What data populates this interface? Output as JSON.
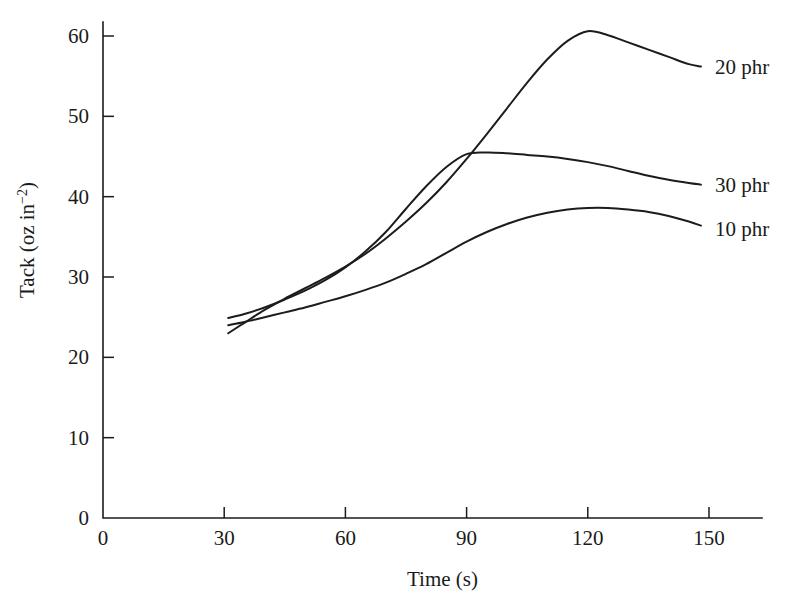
{
  "chart_data": {
    "type": "line",
    "title": "",
    "xlabel": "Time (s)",
    "ylabel": "Tack (oz in⁻²)",
    "ylabel_base": "Tack (oz in",
    "ylabel_exp": "−2",
    "ylabel_close": ")",
    "xlim": [
      0,
      160
    ],
    "ylim": [
      0,
      63
    ],
    "xticks": [
      0,
      30,
      60,
      90,
      120,
      150
    ],
    "xticklabels": [
      "0",
      "30",
      "60",
      "90",
      "120",
      "150"
    ],
    "yticks": [
      0,
      10,
      20,
      30,
      40,
      50,
      60
    ],
    "yticklabels": [
      "0",
      "10",
      "20",
      "30",
      "40",
      "50",
      "60"
    ],
    "grid": false,
    "legend_position": "right-inline-annotations",
    "series": [
      {
        "name": "20 phr",
        "label": "20 phr",
        "label_x": 150,
        "label_y": 56.2,
        "color": "#1c1c1c",
        "x": [
          31,
          35,
          40,
          45,
          50,
          55,
          60,
          65,
          70,
          75,
          80,
          85,
          90,
          95,
          100,
          105,
          110,
          115,
          120,
          125,
          130,
          135,
          140,
          145,
          148
        ],
        "y": [
          23.0,
          24.3,
          25.9,
          27.3,
          28.6,
          29.9,
          31.3,
          32.9,
          34.8,
          36.9,
          39.2,
          41.8,
          44.7,
          47.8,
          51.0,
          54.2,
          57.1,
          59.4,
          60.6,
          60.1,
          59.2,
          58.3,
          57.4,
          56.5,
          56.2
        ]
      },
      {
        "name": "30 phr",
        "label": "30 phr",
        "label_x": 150,
        "label_y": 41.5,
        "color": "#1c1c1c",
        "x": [
          31,
          35,
          40,
          45,
          50,
          55,
          60,
          65,
          70,
          75,
          80,
          85,
          90,
          95,
          100,
          105,
          110,
          115,
          120,
          125,
          130,
          135,
          140,
          145,
          148
        ],
        "y": [
          24.9,
          25.4,
          26.2,
          27.2,
          28.3,
          29.6,
          31.2,
          33.2,
          35.6,
          38.5,
          41.3,
          43.7,
          45.3,
          45.5,
          45.4,
          45.2,
          45.0,
          44.7,
          44.3,
          43.8,
          43.2,
          42.6,
          42.1,
          41.7,
          41.5
        ]
      },
      {
        "name": "10 phr",
        "label": "10 phr",
        "label_x": 150,
        "label_y": 36.0,
        "color": "#1c1c1c",
        "x": [
          31,
          35,
          40,
          45,
          50,
          55,
          60,
          65,
          70,
          75,
          80,
          85,
          90,
          95,
          100,
          105,
          110,
          115,
          120,
          125,
          130,
          135,
          140,
          145,
          148
        ],
        "y": [
          24.0,
          24.4,
          25.0,
          25.6,
          26.2,
          26.9,
          27.6,
          28.4,
          29.3,
          30.4,
          31.6,
          33.0,
          34.4,
          35.6,
          36.6,
          37.4,
          38.0,
          38.4,
          38.6,
          38.6,
          38.4,
          38.1,
          37.6,
          36.9,
          36.4
        ]
      }
    ]
  }
}
